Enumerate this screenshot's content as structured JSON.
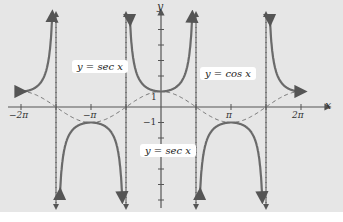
{
  "chart_data": {
    "type": "line",
    "title": "",
    "xlabel": "x",
    "ylabel": "y",
    "xlim": [
      -6.283,
      6.283
    ],
    "x_ticks": [
      "-2π",
      "-3π/2",
      "-π",
      "-π/2",
      "π/2",
      "π",
      "3π/2",
      "2π"
    ],
    "y_ticks": [
      "1",
      "-1"
    ],
    "asymptotes": [
      "-3π/2",
      "-π/2",
      "π/2",
      "3π/2"
    ],
    "series": [
      {
        "name": "y = sec x",
        "style": "solid",
        "color": "#666666"
      },
      {
        "name": "y = cos x",
        "style": "dashed",
        "color": "#777777"
      }
    ],
    "annotations": [
      "y = sec x",
      "y = cos x",
      "y = sec x"
    ]
  },
  "labels": {
    "sec_top": "y = sec x",
    "cos": "y = cos x",
    "sec_bottom": "y = sec x",
    "x_axis": "x",
    "y_axis": "y",
    "ticks": {
      "m2pi": "−2π",
      "m3pi2_n": "3π",
      "mpi": "−π",
      "mpi2_n": "π",
      "pi2_n": "π",
      "pi": "π",
      "p3pi2_n": "3π",
      "p2pi": "2π",
      "den": "2",
      "y1": "1",
      "ym1": "−1"
    }
  }
}
